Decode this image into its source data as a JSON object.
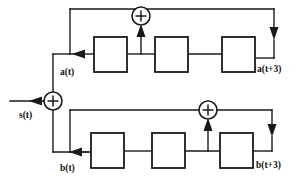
{
  "diagram": {
    "type": "block-diagram",
    "colors": {
      "line": "#1a1a1a",
      "box_fill": "#ffffff",
      "background": "#ffffff"
    },
    "labels": {
      "output_signal": "s(t)",
      "top_input": "a(t)",
      "top_output": "a(t+3)",
      "bottom_input": "b(t)",
      "bottom_output": "b(t+3)"
    },
    "adders": [
      {
        "name": "top-adder",
        "symbol": "+",
        "cx": 141,
        "cy": 16,
        "r": 9
      },
      {
        "name": "main-adder",
        "symbol": "+",
        "cx": 53,
        "cy": 101,
        "r": 9
      },
      {
        "name": "bottom-adder",
        "symbol": "+",
        "cx": 208,
        "cy": 110,
        "r": 9
      }
    ],
    "registers": {
      "top_row": [
        {
          "name": "top-delay-1",
          "x": 94,
          "y": 37,
          "w": 33,
          "h": 35
        },
        {
          "name": "top-delay-2",
          "x": 155,
          "y": 37,
          "w": 33,
          "h": 35
        },
        {
          "name": "top-delay-3",
          "x": 222,
          "y": 37,
          "w": 33,
          "h": 35
        }
      ],
      "bottom_row": [
        {
          "name": "bottom-delay-1",
          "x": 91,
          "y": 133,
          "w": 33,
          "h": 35
        },
        {
          "name": "bottom-delay-2",
          "x": 152,
          "y": 133,
          "w": 33,
          "h": 35
        },
        {
          "name": "bottom-delay-3",
          "x": 220,
          "y": 133,
          "w": 33,
          "h": 35
        }
      ]
    },
    "signal_flow": {
      "top_feedback": "a(t+3) returns left along the top rail through the top adder to a(t)",
      "bottom_feedback": "b(t+3) returns left along the middle rail through the bottom adder to b(t)",
      "output": "s(t) exits leftward from the main adder"
    }
  }
}
